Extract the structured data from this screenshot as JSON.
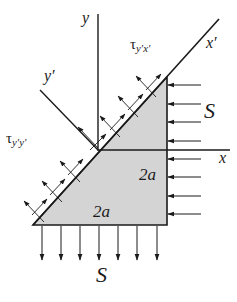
{
  "diagram": {
    "type": "stress-element-inclined-plane",
    "colors": {
      "line": "#1a1a1a",
      "fill": "#d4d4d4",
      "background": "#ffffff"
    },
    "labels": {
      "y_axis": "y",
      "x_axis": "x",
      "x_prime": "x′",
      "y_prime": "y′",
      "tau_yx_prime_symbol": "τ",
      "tau_yx_prime_sub": "y′x′",
      "tau_yy_prime_symbol": "τ",
      "tau_yy_prime_sub": "y′y′",
      "load_right": "S",
      "load_bottom": "S",
      "dim_vertical": "2a",
      "dim_horizontal": "2a"
    },
    "loads": {
      "right_arrow_count": 8,
      "bottom_arrow_count": 7,
      "inclined_arrow_pairs": 6
    }
  }
}
